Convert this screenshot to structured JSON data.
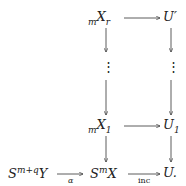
{
  "diagram": {
    "nodes": {
      "mXr": {
        "pre": "m",
        "base": "X",
        "sub": "r"
      },
      "Uprime": {
        "base": "U′"
      },
      "mX1": {
        "pre": "m",
        "base": "X",
        "sub": "1"
      },
      "U1": {
        "base": "U",
        "sub": "1"
      },
      "SmqY": {
        "base": "S",
        "sup": "m+q",
        "tail": "Y"
      },
      "SmX": {
        "base": "S",
        "sup": "m",
        "tail": "X"
      },
      "U": {
        "base": "U."
      }
    },
    "vdots": "⋮",
    "arrows": {
      "alpha": "α",
      "inc": "inc"
    }
  }
}
